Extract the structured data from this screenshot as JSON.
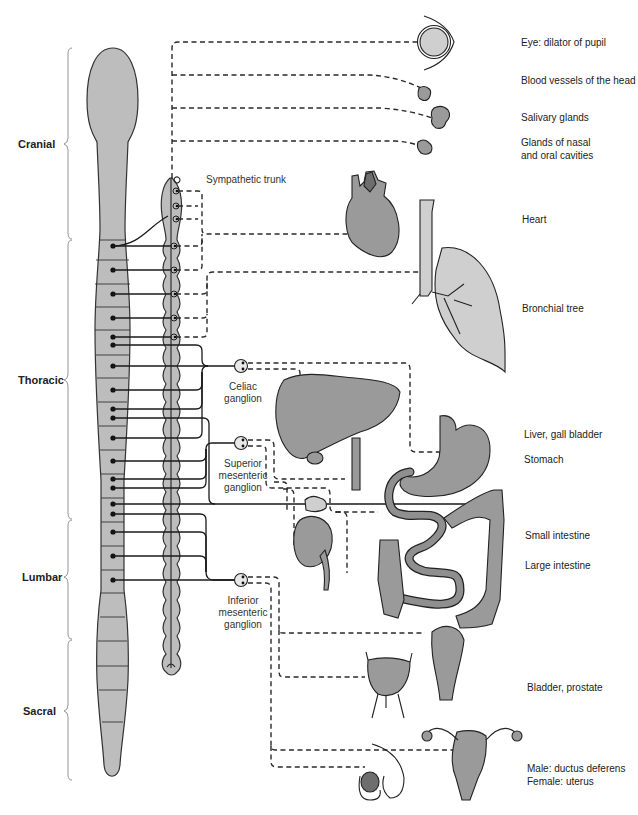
{
  "regions": [
    {
      "id": "cranial",
      "label": "Cranial"
    },
    {
      "id": "thoracic",
      "label": "Thoracic"
    },
    {
      "id": "lumbar",
      "label": "Lumbar"
    },
    {
      "id": "sacral",
      "label": "Sacral"
    }
  ],
  "structures": {
    "sympathetic_trunk": "Sympathetic trunk",
    "celiac_ganglion": [
      "Celiac",
      "ganglion"
    ],
    "superior_mesenteric_ganglion": [
      "Superior",
      "mesenteric",
      "ganglion"
    ],
    "inferior_mesenteric_ganglion": [
      "Inferior",
      "mesenteric",
      "ganglion"
    ]
  },
  "organs": [
    {
      "id": "eye",
      "label": "Eye: dilator of pupil"
    },
    {
      "id": "head-vessels",
      "label": "Blood vessels of the head"
    },
    {
      "id": "salivary",
      "label": "Salivary glands"
    },
    {
      "id": "nasal-oral",
      "label": [
        "Glands of nasal",
        "and oral cavities"
      ]
    },
    {
      "id": "heart",
      "label": "Heart"
    },
    {
      "id": "bronchial",
      "label": "Bronchial tree"
    },
    {
      "id": "liver",
      "label": "Liver, gall bladder"
    },
    {
      "id": "stomach",
      "label": "Stomach"
    },
    {
      "id": "small-intestine",
      "label": "Small intestine"
    },
    {
      "id": "large-intestine",
      "label": "Large intestine"
    },
    {
      "id": "bladder",
      "label": "Bladder, prostate"
    },
    {
      "id": "reproductive",
      "label": [
        "Male: ductus deferens",
        "Female: uterus"
      ]
    }
  ],
  "colors": {
    "cord_fill": "#bdbdbd",
    "organ_fill": "#9a9a9a",
    "line": "#1a1a1a",
    "brace": "#888888"
  }
}
